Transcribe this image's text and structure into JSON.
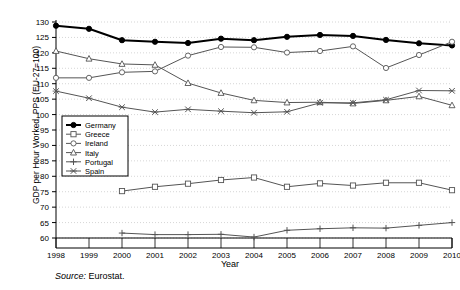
{
  "chart_data": {
    "type": "line",
    "title": "",
    "xlabel": "Year",
    "ylabel": "GDP per Hour Worked, PPS (EU-27=100)",
    "x": [
      1998,
      1999,
      2000,
      2001,
      2002,
      2003,
      2004,
      2005,
      2006,
      2007,
      2008,
      2009,
      2010
    ],
    "xticklabels": [
      "1998",
      "1999",
      "2000",
      "2001",
      "2002",
      "2003",
      "2004",
      "2005",
      "2006",
      "2007",
      "2008",
      "2009",
      "2010"
    ],
    "yticks": [
      60,
      65,
      70,
      75,
      80,
      85,
      90,
      95,
      100,
      105,
      110,
      115,
      120,
      125,
      130
    ],
    "ylim": [
      60,
      130
    ],
    "xlim": [
      1998,
      2010
    ],
    "grid": true,
    "grid_style": "dotted-horizontal",
    "legend_position": "left-middle",
    "series": [
      {
        "name": "Germany",
        "marker": "filled-circle",
        "color": "#000000",
        "linewidth": 2.0,
        "values": [
          128.8,
          127.8,
          124.1,
          123.6,
          123.2,
          124.6,
          124.1,
          125.2,
          125.8,
          125.5,
          124.2,
          123.1,
          122.4
        ]
      },
      {
        "name": "Greece",
        "marker": "open-square",
        "color": "#555555",
        "linewidth": 1.0,
        "values": [
          null,
          null,
          75.2,
          76.6,
          77.6,
          78.8,
          79.6,
          76.6,
          77.7,
          77.0,
          77.9,
          77.9,
          75.5
        ]
      },
      {
        "name": "Ireland",
        "marker": "open-circle",
        "color": "#555555",
        "linewidth": 1.0,
        "values": [
          111.9,
          111.9,
          113.7,
          114.0,
          119.1,
          121.9,
          121.8,
          120.1,
          120.6,
          122.1,
          115.1,
          119.3,
          123.6
        ]
      },
      {
        "name": "Italy",
        "marker": "open-triangle",
        "color": "#555555",
        "linewidth": 1.0,
        "values": [
          120.6,
          118.1,
          116.4,
          116.1,
          110.2,
          107.0,
          104.6,
          103.9,
          104.0,
          103.6,
          104.6,
          105.9,
          103.0
        ]
      },
      {
        "name": "Portugal",
        "marker": "plus",
        "color": "#555555",
        "linewidth": 1.0,
        "values": [
          null,
          null,
          61.6,
          61.1,
          61.1,
          61.2,
          60.3,
          62.5,
          63.0,
          63.3,
          63.2,
          64.1,
          65.0
        ]
      },
      {
        "name": "Spain",
        "marker": "cross-x",
        "color": "#555555",
        "linewidth": 1.0,
        "values": [
          107.6,
          105.3,
          102.4,
          100.8,
          101.7,
          101.1,
          100.6,
          100.9,
          103.8,
          103.8,
          104.8,
          107.8,
          107.7
        ]
      }
    ]
  },
  "source": {
    "prefix": "Source:",
    "text": "Eurostat."
  }
}
